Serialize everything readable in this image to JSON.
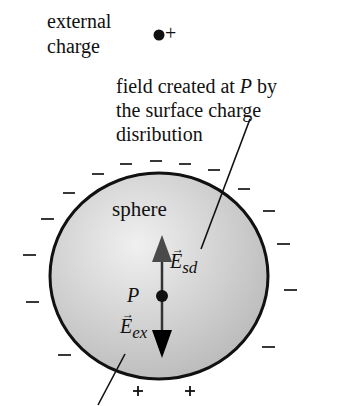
{
  "labels": {
    "external_line1": "external",
    "external_line2": "charge",
    "external_sign": "+",
    "field_line1_a": "field created at ",
    "field_line1_p": "P",
    "field_line1_b": " by",
    "field_line2": "the surface charge",
    "field_line3": "disribution",
    "sphere": "sphere",
    "point": "P",
    "e_sd_main": "E",
    "e_sd_sub": "sd",
    "e_ex_main": "E",
    "e_ex_sub": "ex",
    "plus": "+",
    "minus": "–"
  },
  "colors": {
    "sphere_fill_light": "#ececec",
    "sphere_fill_dark": "#b9b9b9",
    "outline": "#111111",
    "up_arrow": "#444444",
    "down_arrow": "#000000"
  }
}
